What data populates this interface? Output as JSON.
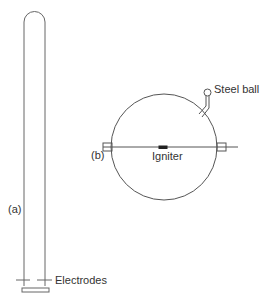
{
  "figure": {
    "panel_a": {
      "label": "(a)",
      "component": "tube",
      "callouts": [
        {
          "text": "Electrodes"
        }
      ]
    },
    "panel_b": {
      "label": "(b)",
      "component": "sphere",
      "callouts": [
        {
          "text": "Steel ball"
        },
        {
          "text": "Igniter"
        }
      ]
    }
  },
  "colors": {
    "line": "#555555",
    "text": "#333333",
    "background": "#ffffff"
  }
}
